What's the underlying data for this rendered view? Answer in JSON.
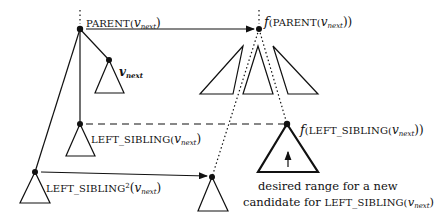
{
  "diagram": {
    "type": "tree-mapping-illustration",
    "labels": {
      "parent": {
        "prefix": "PARENT(",
        "var": "v",
        "sub": "next",
        "suffix": ")"
      },
      "v_next": {
        "var": "v",
        "sub": "next"
      },
      "left_sibling": {
        "prefix": "LEFT_SIBLING(",
        "var": "v",
        "sub": "next",
        "suffix": ")"
      },
      "left_sibling2": {
        "prefix": "LEFT_SIBLING",
        "sup": "2",
        "open": "(",
        "var": "v",
        "sub": "next",
        "suffix": ")"
      },
      "f_parent": {
        "f": "f",
        "prefix": "(PARENT(",
        "var": "v",
        "sub": "next",
        "suffix": "))"
      },
      "f_left_sibling": {
        "f": "f",
        "prefix": "(LEFT_SIBLING(",
        "var": "v",
        "sub": "next",
        "suffix": "))"
      },
      "caption_line1": "desired range for a new",
      "caption_line2_prefix": "candidate for ",
      "caption_line2_sc": "LEFT_SIBLING(",
      "caption_line2_var": "v",
      "caption_line2_sub": "next",
      "caption_line2_suffix": ")"
    },
    "nodes": [
      {
        "id": "parent",
        "x": 80,
        "y": 29
      },
      {
        "id": "v_next",
        "x": 109,
        "y": 60
      },
      {
        "id": "left_sibling",
        "x": 80,
        "y": 124
      },
      {
        "id": "left_sibling2",
        "x": 35,
        "y": 172
      },
      {
        "id": "f_parent",
        "x": 259,
        "y": 29
      },
      {
        "id": "f_left_sibling",
        "x": 287,
        "y": 124
      },
      {
        "id": "f_left_sibling2",
        "x": 212,
        "y": 177
      }
    ],
    "edges": [
      {
        "from": "parent",
        "to": "f_parent",
        "style": "solid-arrow"
      },
      {
        "from": "left_sibling",
        "to": "f_left_sibling",
        "style": "dashed"
      },
      {
        "from": "left_sibling2",
        "to": "f_left_sibling2",
        "style": "solid-arrow"
      },
      {
        "from": "f_parent",
        "to": "f_left_sibling2",
        "style": "dotted"
      },
      {
        "from": "f_parent",
        "to": "f_left_sibling",
        "style": "dotted"
      }
    ]
  }
}
